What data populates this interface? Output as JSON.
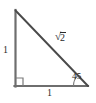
{
  "figure": {
    "background_color": "#ffffff",
    "stroke_color": "#6e6e6e",
    "hypotenuse_color": "#4a4a4a",
    "text_color": "#2b2b2b"
  },
  "geometry": {
    "vertices": {
      "top": {
        "x": 15,
        "y": 10
      },
      "bottom_left": {
        "x": 15,
        "y": 86
      },
      "bottom_right": {
        "x": 88,
        "y": 86
      }
    },
    "right_angle_marker": {
      "at_vertex": "bottom_left",
      "size": 8
    },
    "angle_arc": {
      "at_vertex": "bottom_right",
      "radius": 15
    }
  },
  "labels": {
    "leg_vertical": "1",
    "leg_horizontal": "1",
    "angle": "45",
    "hypotenuse": {
      "radical": "√",
      "radicand": "2",
      "full": "√2"
    }
  }
}
